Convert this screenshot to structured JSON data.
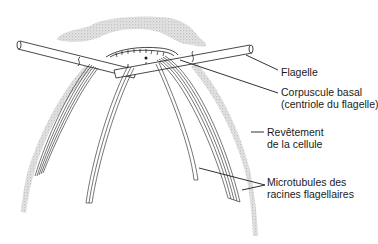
{
  "diagram": {
    "colors": {
      "ink": "#1a1a1a",
      "stipple": "#b8b8b8",
      "background": "#ffffff"
    },
    "labels": [
      {
        "id": "flagelle",
        "lines": [
          "Flagelle"
        ]
      },
      {
        "id": "corpuscule",
        "lines": [
          "Corpuscule basal",
          "(centriole du flagelle)"
        ]
      },
      {
        "id": "revetement",
        "lines": [
          "Revêtement",
          "de la cellule"
        ]
      },
      {
        "id": "microtubules",
        "lines": [
          "Microtubules des",
          "racines flagellaires"
        ]
      }
    ]
  }
}
